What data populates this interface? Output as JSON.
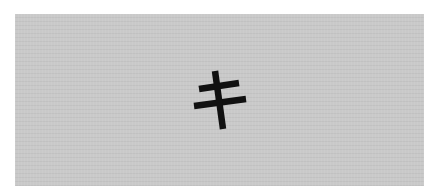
{
  "image": {
    "character": "キ",
    "background_color": "#c9c9c9",
    "stroke_color": "#111111",
    "border_color": "#ffffff"
  }
}
